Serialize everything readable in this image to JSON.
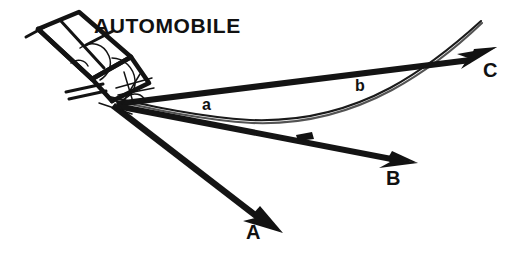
{
  "figure": {
    "title_label": "AUTOMOBILE",
    "background_color": "#ffffff",
    "ink_color": "#121212",
    "width": 524,
    "height": 261,
    "subject": {
      "name": "automobile",
      "label": "AUTOMOBILE",
      "position": "upper-left",
      "orientation": "tilted, nose pointing down-right"
    },
    "vectors": [
      {
        "id": "A",
        "label": "A",
        "label_x": 246,
        "label_y": 222,
        "origin": [
          118,
          104
        ],
        "tip": [
          277,
          228
        ],
        "direction": "down-right",
        "style": "solid tapered arrow"
      },
      {
        "id": "B",
        "label": "B",
        "label_x": 386,
        "label_y": 168,
        "origin": [
          118,
          104
        ],
        "tip": [
          412,
          163
        ],
        "direction": "right, slightly downward",
        "style": "solid tapered arrow"
      },
      {
        "id": "C",
        "label": "C",
        "label_x": 483,
        "label_y": 60,
        "origin": [
          118,
          104
        ],
        "tip": [
          492,
          50
        ],
        "direction": "right and upward",
        "style": "solid tapered arrow"
      }
    ],
    "curve_points": [
      {
        "id": "a",
        "label": "a",
        "label_x": 202,
        "label_y": 97,
        "on": "trajectory-curve",
        "approx_position": [
          210,
          112
        ]
      },
      {
        "id": "b",
        "label": "b",
        "label_x": 355,
        "label_y": 78,
        "on": "trajectory-curve",
        "approx_position": [
          362,
          100
        ]
      }
    ],
    "trajectory": {
      "name": "trajectory-curve",
      "description": "thin curved path sweeping down from the automobile, bottoming out near mid-figure, then rising to the upper right",
      "start": [
        112,
        100
      ],
      "low_point": [
        292,
        119
      ],
      "end": [
        480,
        22
      ]
    }
  }
}
